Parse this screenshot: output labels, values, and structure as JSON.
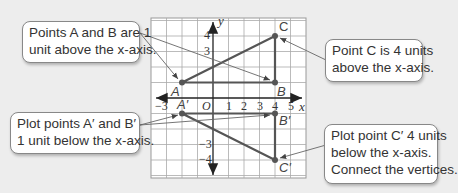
{
  "notes": {
    "ab_above": {
      "line1": "Points A and B are 1",
      "line2": "unit above the x-axis."
    },
    "c_above": {
      "line1": "Point C is 4 units",
      "line2": "above the x-axis."
    },
    "ab_below": {
      "line1": "Plot points A′ and B′",
      "line2": "1 unit below the x-axis."
    },
    "c_below": {
      "line1": "Plot point C′ 4 units",
      "line2": "below the x-axis.",
      "line3": "Connect the vertices."
    }
  },
  "graph": {
    "x_label": "x",
    "y_label": "y",
    "origin_label": "O",
    "x_ticks": [
      "−3",
      "1",
      "2",
      "3",
      "4",
      "5"
    ],
    "y_ticks": [
      "4",
      "3",
      "−3",
      "−4"
    ],
    "points": {
      "A": {
        "label": "A",
        "x": -2,
        "y": 1
      },
      "B": {
        "label": "B",
        "x": 4,
        "y": 1
      },
      "C": {
        "label": "C",
        "x": 4,
        "y": 4
      },
      "A_prime": {
        "label": "A′",
        "x": -2,
        "y": -1
      },
      "B_prime": {
        "label": "B′",
        "x": 4,
        "y": -1
      },
      "C_prime": {
        "label": "C′",
        "x": 4,
        "y": -4
      }
    }
  }
}
